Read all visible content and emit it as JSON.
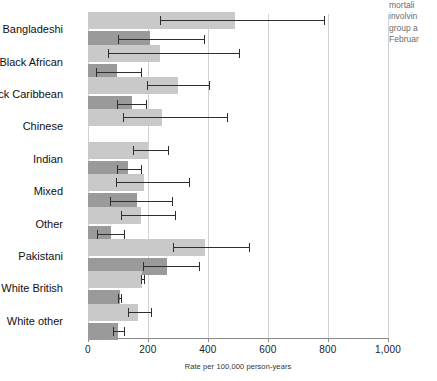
{
  "chart_data": {
    "type": "bar",
    "orientation": "horizontal",
    "title": "",
    "xlabel": "Rate per 100,000 person-years",
    "ylabel": "",
    "xlim": [
      0,
      1000
    ],
    "xticks": [
      0,
      200,
      400,
      600,
      800,
      1000
    ],
    "xtick_labels": [
      "0",
      "200",
      "400",
      "600",
      "800",
      "1,000"
    ],
    "grid": true,
    "legend": "none",
    "categories": [
      "Bangladeshi",
      "Black African",
      "Black Caribbean",
      "Chinese",
      "Indian",
      "Mixed",
      "Other",
      "Pakistani",
      "White British",
      "White other"
    ],
    "series": [
      {
        "name": "light",
        "color": "#c9c9c9",
        "values": [
          490,
          240,
          300,
          245,
          200,
          185,
          175,
          390,
          180,
          167
        ],
        "ci_low": [
          240,
          65,
          195,
          115,
          150,
          92,
          110,
          283,
          175,
          133
        ],
        "ci_high": [
          790,
          505,
          405,
          465,
          270,
          340,
          293,
          540,
          190,
          213
        ]
      },
      {
        "name": "dark",
        "color": "#9a9a9a",
        "values": [
          205,
          95,
          145,
          null,
          133,
          163,
          77,
          263,
          105,
          100
        ],
        "ci_low": [
          100,
          25,
          95,
          null,
          95,
          73,
          30,
          183,
          100,
          83
        ],
        "ci_high": [
          390,
          180,
          195,
          null,
          180,
          283,
          123,
          373,
          113,
          123
        ]
      }
    ]
  },
  "side_note": {
    "lines": [
      "mortali",
      "involvin",
      "group a",
      "Februar"
    ]
  }
}
